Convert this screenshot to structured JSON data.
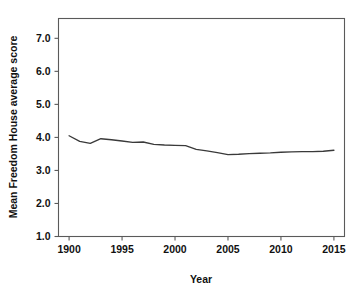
{
  "chart_data": {
    "type": "line",
    "title": "",
    "subtitle": "",
    "xlabel": "Year",
    "ylabel": "Mean Freedom House average score",
    "xlim": [
      1989,
      2016
    ],
    "ylim": [
      1.0,
      7.6
    ],
    "grid": false,
    "legend": "none",
    "legend_position": "none",
    "xticks": [
      "1900",
      "1995",
      "2000",
      "2005",
      "2010",
      "2015"
    ],
    "xtick_values": [
      1990,
      1995,
      2000,
      2005,
      2010,
      2015
    ],
    "yticks": [
      "1.0",
      "2.0",
      "3.0",
      "4.0",
      "5.0",
      "6.0",
      "7.0"
    ],
    "ytick_values": [
      1.0,
      2.0,
      3.0,
      4.0,
      5.0,
      6.0,
      7.0
    ],
    "series": [
      {
        "name": "Mean Freedom House average score",
        "color": "#3a3a3a",
        "x": [
          1990,
          1991,
          1992,
          1993,
          1994,
          1995,
          1996,
          1997,
          1998,
          1999,
          2000,
          2001,
          2002,
          2003,
          2004,
          2005,
          2006,
          2007,
          2008,
          2009,
          2010,
          2011,
          2012,
          2013,
          2014,
          2015
        ],
        "values": [
          4.05,
          3.88,
          3.82,
          3.96,
          3.93,
          3.89,
          3.85,
          3.86,
          3.79,
          3.77,
          3.76,
          3.75,
          3.64,
          3.59,
          3.54,
          3.48,
          3.49,
          3.51,
          3.52,
          3.53,
          3.55,
          3.56,
          3.57,
          3.57,
          3.58,
          3.61
        ]
      }
    ]
  },
  "axes": {
    "x_title": "Year",
    "y_title": "Mean Freedom House average score"
  },
  "colors": {
    "line": "#3a3a3a",
    "axis": "#5a5a5a",
    "text": "#111111",
    "background": "#ffffff"
  }
}
